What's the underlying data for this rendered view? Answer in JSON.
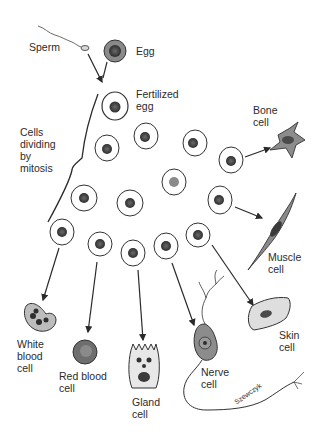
{
  "diagram": {
    "labels": {
      "sperm": "Sperm",
      "egg": "Egg",
      "fertilized_egg": "Fertilized\negg",
      "mitosis": "Cells\ndividing\nby\nmitosis",
      "bone_cell": "Bone\ncell",
      "muscle_cell": "Muscle\ncell",
      "white_blood_cell": "White\nblood\ncell",
      "red_blood_cell": "Red blood\ncell",
      "gland_cell": "Gland\ncell",
      "nerve_cell": "Nerve\ncell",
      "skin_cell": "Skin\ncell",
      "signature": "Szewczyk"
    },
    "colors": {
      "ink": "#2a2a2a",
      "cell_fill": "#ffffff",
      "nucleus": "#4a4a4a",
      "specialized_fill": "#9a9a9a",
      "red_cell_fill": "#6e6e6e"
    }
  }
}
